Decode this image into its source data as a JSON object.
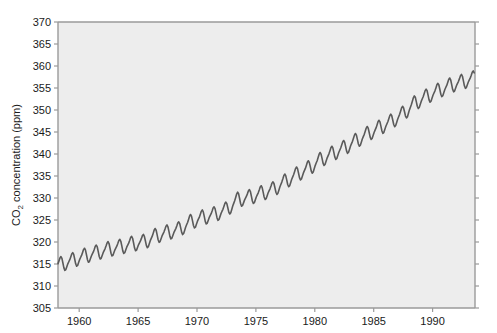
{
  "chart_data": {
    "type": "line",
    "title": "",
    "subtitle": "",
    "xlabel": "",
    "ylabel": "CO2 concentration (ppm)",
    "ylabel_parts": {
      "pre": "CO",
      "sub": "2",
      "post": " concentration (ppm)"
    },
    "xlim": [
      1958.2,
      1993.6
    ],
    "ylim": [
      305,
      370
    ],
    "xticks": [
      1960,
      1965,
      1970,
      1975,
      1980,
      1985,
      1990
    ],
    "xtick_labels": [
      "1960",
      "1965",
      "1970",
      "1975",
      "1980",
      "1985",
      "1990"
    ],
    "yticks": [
      305,
      310,
      315,
      320,
      325,
      330,
      335,
      340,
      345,
      350,
      355,
      360,
      365,
      370
    ],
    "ytick_labels": [
      "305",
      "310",
      "315",
      "320",
      "325",
      "330",
      "335",
      "340",
      "345",
      "350",
      "355",
      "360",
      "365",
      "370"
    ],
    "grid": false,
    "legend": null,
    "plot_background_color": "#ededed",
    "figure_background_color": "#ffffff",
    "axis_color": "#9a9a9a",
    "line_color": "#5a5a5a",
    "line_width": 1.6,
    "series": [
      {
        "name": "Mauna Loa monthly mean CO2",
        "description": "Monthly mean atmospheric CO2 concentration showing a rising trend with an annual sawtooth seasonal cycle.",
        "trend_model": {
          "note": "annual mean CO2 trend, values in ppm at mid-year",
          "x": [
            1958.5,
            1959.5,
            1960.5,
            1961.5,
            1962.5,
            1963.5,
            1964.5,
            1965.5,
            1966.5,
            1967.5,
            1968.5,
            1969.5,
            1970.5,
            1971.5,
            1972.5,
            1973.5,
            1974.5,
            1975.5,
            1976.5,
            1977.5,
            1978.5,
            1979.5,
            1980.5,
            1981.5,
            1982.5,
            1983.5,
            1984.5,
            1985.5,
            1986.5,
            1987.5,
            1988.5,
            1989.5,
            1990.5,
            1991.5,
            1992.5,
            1993.4
          ],
          "y": [
            315.0,
            315.9,
            316.9,
            317.6,
            318.4,
            318.9,
            319.6,
            320.0,
            321.4,
            322.2,
            322.9,
            324.6,
            325.6,
            326.3,
            327.4,
            329.7,
            330.2,
            331.1,
            332.0,
            333.8,
            335.4,
            336.8,
            338.7,
            340.1,
            341.4,
            343.0,
            344.6,
            346.0,
            347.4,
            349.2,
            351.6,
            353.1,
            354.4,
            355.6,
            356.4,
            357.1
          ]
        },
        "seasonal_amplitude_ppm": 3.1,
        "seasonal_peak_month": 5,
        "seasonal_trough_month": 10,
        "y_min_observed": 313.2,
        "y_max_observed": 361.0,
        "units": "ppm",
        "x_units": "year"
      }
    ]
  },
  "plot_geometry": {
    "left_px": 58,
    "right_px": 475,
    "top_px": 22,
    "bottom_px": 308,
    "tick_length_px": 4,
    "right_axis_ticks": true,
    "top_axis_ticks": false
  }
}
